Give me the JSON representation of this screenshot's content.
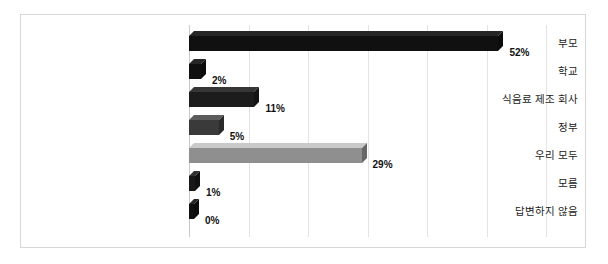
{
  "chart_data": {
    "type": "bar",
    "orientation": "horizontal",
    "title": "",
    "subtitle": "",
    "xlabel": "",
    "ylabel": "",
    "xlim": [
      0,
      60
    ],
    "grid": true,
    "gridlines": [
      0,
      10,
      20,
      30,
      40,
      50,
      60
    ],
    "legend": "none",
    "categories": [
      "부모",
      "학교",
      "식음료 제조 회사",
      "정부",
      "우리 모두",
      "모름",
      "답변하지 않음"
    ],
    "values": [
      52,
      2,
      11,
      5,
      29,
      1,
      0
    ],
    "value_labels": [
      "52%",
      "2%",
      "11%",
      "5%",
      "29%",
      "1%",
      "0%"
    ],
    "bar_colors": [
      "#101010",
      "#101010",
      "#1c1c1c",
      "#3a3a3a",
      "#8f8f8f",
      "#181818",
      "#101010"
    ],
    "series": [
      {
        "name": "",
        "values": [
          52,
          2,
          11,
          5,
          29,
          1,
          0
        ]
      }
    ]
  },
  "style": {
    "frame_color": "#d6d6d6",
    "grid_color": "#e3e3e3",
    "axis_color": "#c9c9c9",
    "background": "#ffffff",
    "label_color": "#1b1b1b",
    "value_color": "#111111"
  }
}
